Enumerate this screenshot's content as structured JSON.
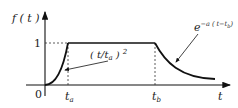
{
  "figure": {
    "y_axis_label": "f ( t )",
    "x_axis_label": "t",
    "origin_label": "0",
    "level_label": "1",
    "ta_label": "t",
    "ta_sub": "a",
    "tb_label": "t",
    "tb_sub": "b",
    "rise_annotation": "( t/t",
    "rise_annotation_sub": "a",
    "rise_annotation_close": " )",
    "rise_annotation_exp": "2",
    "decay_annotation_base": "e",
    "decay_annotation_exp": "−a ( t−t",
    "decay_annotation_exp_sub": "b",
    "decay_annotation_exp_close": ")"
  },
  "colors": {
    "stroke": "#111111",
    "text": "#222222"
  }
}
